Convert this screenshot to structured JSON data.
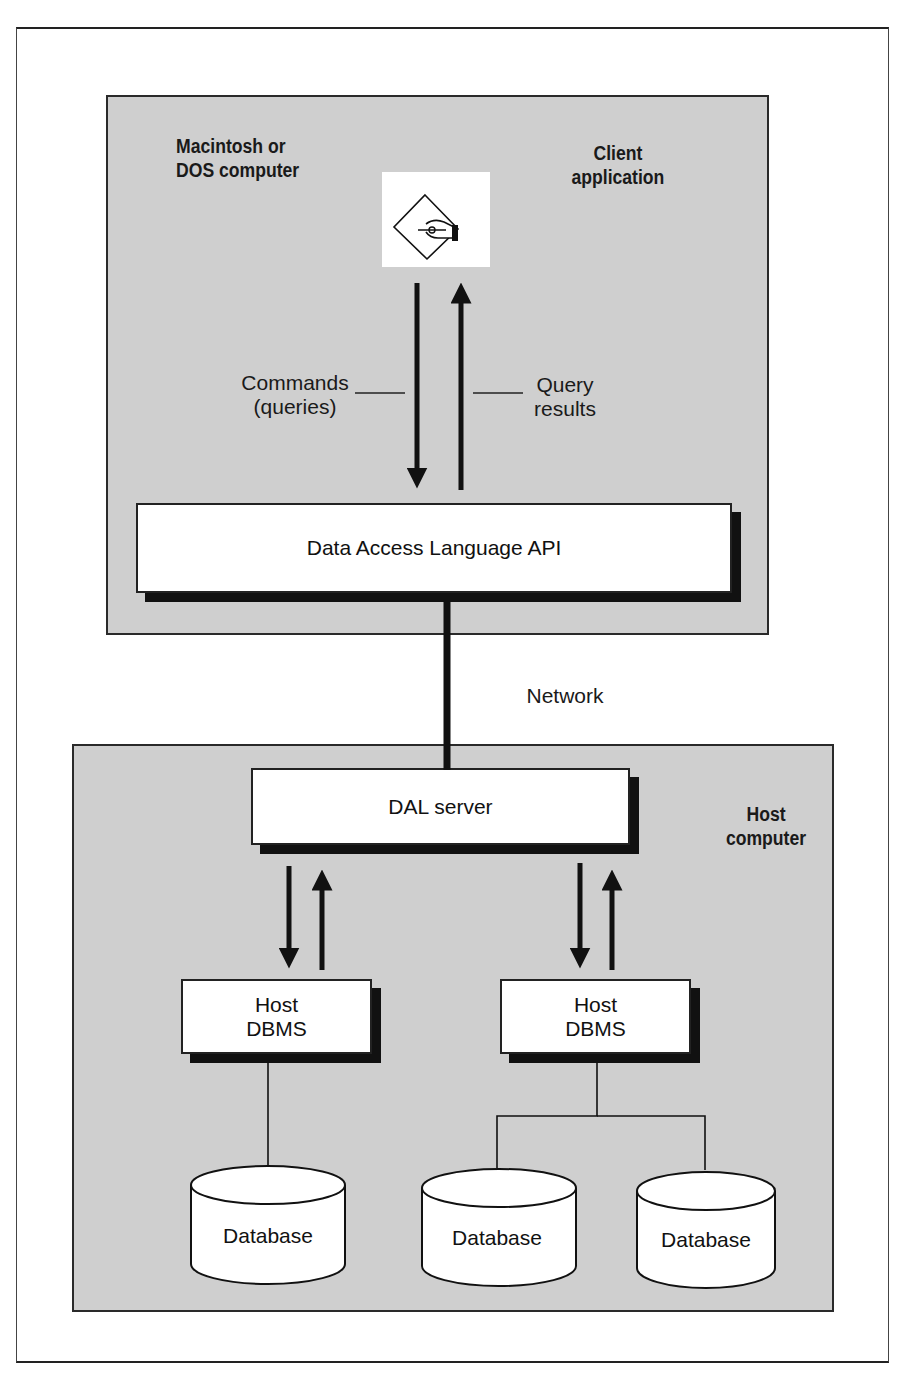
{
  "diagram": {
    "client_region": {
      "title": "Macintosh or DOS computer",
      "title_lines": [
        "Macintosh or",
        "DOS computer"
      ],
      "app_label_lines": [
        "Client",
        "application"
      ],
      "app_icon": "pen-in-hand-diamond-icon"
    },
    "flow_labels": {
      "commands_lines": [
        "Commands",
        "(queries)"
      ],
      "results_lines": [
        "Query",
        "results"
      ]
    },
    "api_box": {
      "label": "Data Access Language API"
    },
    "network_label": "Network",
    "host_region": {
      "title_lines": [
        "Host",
        "computer"
      ]
    },
    "server_box": {
      "label": "DAL server"
    },
    "dbms_boxes": [
      {
        "lines": [
          "Host",
          "DBMS"
        ]
      },
      {
        "lines": [
          "Host",
          "DBMS"
        ]
      }
    ],
    "databases": [
      {
        "label": "Database"
      },
      {
        "label": "Database"
      },
      {
        "label": "Database"
      }
    ],
    "colors": {
      "region_fill": "#cfcfcf",
      "box_fill": "#ffffff",
      "line": "#111111"
    }
  }
}
